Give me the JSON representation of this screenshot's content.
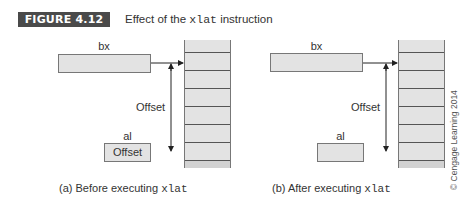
{
  "figure": {
    "label": "FIGURE 4.12",
    "title_prefix": "Effect of the ",
    "title_code": "xlat",
    "title_suffix": " instruction",
    "label_bg": "#4a4a4a"
  },
  "panels": [
    {
      "id": "a",
      "bx_label": "bx",
      "al_label": "al",
      "al_value": "Offset",
      "offset_label": "Offset",
      "caption_prefix": "(a) Before executing ",
      "caption_code": "xlat"
    },
    {
      "id": "b",
      "bx_label": "bx",
      "al_label": "al",
      "al_value": "",
      "offset_label": "Offset",
      "caption_prefix": "(b) After executing ",
      "caption_code": "xlat"
    }
  ],
  "memory": {
    "cell_count": 7,
    "highlighted_index": 6
  },
  "copyright": "© Cengage Learning 2014",
  "colors": {
    "register_fill": "#e3e3e3",
    "memory_fill": "#e3e3e3",
    "highlight_fill": "#d2d2d2",
    "line": "#555555"
  }
}
